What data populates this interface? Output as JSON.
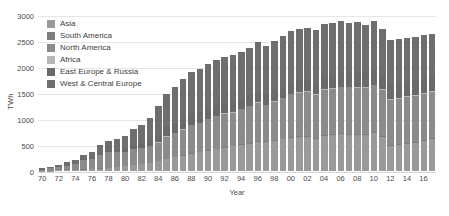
{
  "chart_data": {
    "type": "bar",
    "subtype": "stacked-bar",
    "title": "",
    "xlabel": "Year",
    "ylabel": "TWh",
    "ylim": [
      0,
      3000
    ],
    "yticks": [
      3000,
      2500,
      2000,
      1500,
      1000,
      500,
      0
    ],
    "grid": true,
    "legend_position": "top-left",
    "categories": [
      "70",
      "71",
      "72",
      "73",
      "74",
      "75",
      "76",
      "77",
      "78",
      "79",
      "80",
      "81",
      "82",
      "83",
      "84",
      "85",
      "86",
      "87",
      "88",
      "89",
      "90",
      "91",
      "92",
      "93",
      "94",
      "95",
      "96",
      "97",
      "98",
      "99",
      "00",
      "01",
      "02",
      "03",
      "04",
      "05",
      "06",
      "07",
      "08",
      "09",
      "10",
      "11",
      "12",
      "13",
      "14",
      "15",
      "16",
      "17"
    ],
    "xtick_labels": [
      "70",
      "",
      "72",
      "",
      "74",
      "",
      "76",
      "",
      "78",
      "",
      "80",
      "",
      "82",
      "",
      "84",
      "",
      "86",
      "",
      "88",
      "",
      "90",
      "",
      "92",
      "",
      "94",
      "",
      "96",
      "",
      "98",
      "",
      "00",
      "",
      "02",
      "",
      "04",
      "",
      "06",
      "",
      "08",
      "",
      "10",
      "",
      "12",
      "",
      "14",
      "",
      "16",
      ""
    ],
    "series": [
      {
        "name": "West & Central Europe",
        "color": "#6e6e6e",
        "values": [
          25,
          32,
          42,
          52,
          62,
          85,
          105,
          140,
          175,
          200,
          225,
          300,
          345,
          420,
          545,
          640,
          700,
          760,
          800,
          825,
          845,
          880,
          890,
          905,
          915,
          925,
          955,
          940,
          955,
          975,
          980,
          990,
          985,
          990,
          1010,
          1000,
          1000,
          960,
          975,
          930,
          950,
          890,
          870,
          860,
          845,
          840,
          830,
          810
        ]
      },
      {
        "name": "East Europe & Russia",
        "color": "#6a6a6a",
        "values": [
          4,
          6,
          9,
          12,
          16,
          22,
          30,
          40,
          52,
          62,
          75,
          90,
          105,
          125,
          150,
          175,
          190,
          205,
          215,
          215,
          210,
          200,
          195,
          195,
          195,
          200,
          205,
          200,
          205,
          215,
          225,
          230,
          240,
          245,
          255,
          260,
          270,
          275,
          280,
          275,
          285,
          280,
          275,
          275,
          280,
          285,
          290,
          295
        ]
      },
      {
        "name": "Africa",
        "color": "#b6b6b6",
        "values": [
          0,
          0,
          0,
          0,
          0,
          0,
          0,
          0,
          0,
          0,
          0,
          0,
          0,
          2,
          5,
          6,
          8,
          9,
          10,
          10,
          9,
          9,
          10,
          10,
          11,
          11,
          12,
          13,
          13,
          13,
          13,
          11,
          12,
          13,
          14,
          12,
          10,
          12,
          13,
          12,
          12,
          13,
          13,
          13,
          14,
          11,
          15,
          15
        ]
      },
      {
        "name": "North America",
        "color": "#8b8b8b",
        "values": [
          24,
          42,
          62,
          88,
          120,
          180,
          200,
          265,
          300,
          290,
          285,
          305,
          310,
          320,
          355,
          430,
          455,
          490,
          545,
          555,
          600,
          630,
          645,
          640,
          670,
          710,
          745,
          700,
          740,
          780,
          830,
          840,
          860,
          840,
          880,
          880,
          890,
          900,
          900,
          890,
          900,
          895,
          880,
          880,
          890,
          890,
          890,
          900
        ]
      },
      {
        "name": "South America",
        "color": "#7d7d7d",
        "values": [
          0,
          0,
          0,
          0,
          1,
          2,
          2,
          2,
          3,
          3,
          3,
          4,
          5,
          5,
          6,
          8,
          9,
          9,
          10,
          10,
          11,
          11,
          12,
          12,
          12,
          12,
          12,
          12,
          13,
          13,
          14,
          14,
          14,
          15,
          16,
          16,
          17,
          18,
          18,
          19,
          19,
          20,
          20,
          21,
          22,
          22,
          22,
          23
        ]
      },
      {
        "name": "Asia",
        "color": "#9a9a9a",
        "values": [
          4,
          8,
          12,
          15,
          20,
          28,
          38,
          48,
          60,
          72,
          90,
          110,
          130,
          155,
          190,
          230,
          265,
          300,
          330,
          360,
          390,
          420,
          450,
          480,
          510,
          530,
          560,
          560,
          590,
          615,
          640,
          665,
          660,
          620,
          675,
          700,
          715,
          700,
          690,
          700,
          740,
          660,
          480,
          500,
          520,
          540,
          580,
          610
        ]
      }
    ]
  },
  "legend": {
    "items": [
      {
        "label": "Asia"
      },
      {
        "label": "South America"
      },
      {
        "label": "North America"
      },
      {
        "label": "Africa"
      },
      {
        "label": "East Europe & Russia"
      },
      {
        "label": "West & Central Europe"
      }
    ]
  }
}
